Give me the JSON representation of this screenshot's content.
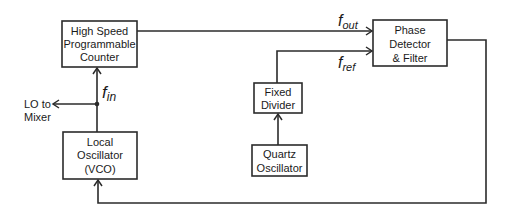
{
  "blocks": {
    "counter": {
      "lines": [
        "High Speed",
        "Programmable",
        "Counter"
      ]
    },
    "vco": {
      "lines": [
        "Local",
        "Oscillator",
        "(VCO)"
      ]
    },
    "phase_detector": {
      "lines": [
        "Phase",
        "Detector",
        "& Filter"
      ]
    },
    "divider": {
      "lines": [
        "Fixed",
        "Divider"
      ]
    },
    "quartz": {
      "lines": [
        "Quartz",
        "Oscillator"
      ]
    }
  },
  "signals": {
    "f_out": {
      "base": "f",
      "sub": "out"
    },
    "f_ref": {
      "base": "f",
      "sub": "ref"
    },
    "f_in": {
      "base": "f",
      "sub": "in"
    }
  },
  "output_label": {
    "lines": [
      "LO to",
      "Mixer"
    ]
  },
  "colors": {
    "line": "#2b2b2b",
    "text": "#1a1a1a",
    "background": "#ffffff"
  }
}
